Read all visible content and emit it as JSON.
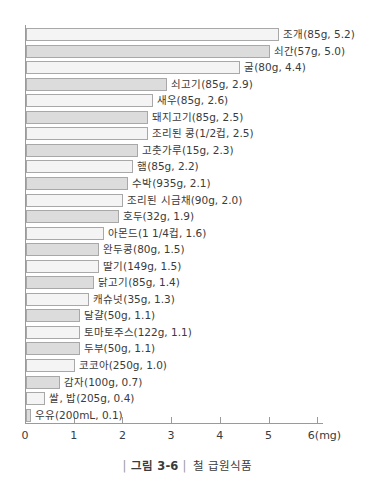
{
  "chart_data": {
    "type": "bar",
    "orientation": "horizontal",
    "title": "철 급원식품",
    "xlabel": "6(mg)",
    "ylabel": "",
    "xlim": [
      0,
      6
    ],
    "xticks": [
      0,
      1,
      2,
      3,
      4,
      5,
      6
    ],
    "xtick_labels": [
      "0",
      "1",
      "2",
      "3",
      "4",
      "5",
      "6(mg)"
    ],
    "grid": false,
    "legend": "none",
    "unit": "mg",
    "categories": [
      "조개",
      "쇠간",
      "굴",
      "쇠고기",
      "새우",
      "돼지고기",
      "조리된 콩",
      "고춧가루",
      "햄",
      "수박",
      "조리된 시금치",
      "호두",
      "아몬드",
      "완두콩",
      "딸기",
      "닭고기",
      "캐슈넛",
      "달걀",
      "토마토주스",
      "두부",
      "코코아",
      "감자",
      "쌀, 밥",
      "우유"
    ],
    "values": [
      5.2,
      5.0,
      4.4,
      2.9,
      2.6,
      2.5,
      2.5,
      2.3,
      2.2,
      2.1,
      2.0,
      1.9,
      1.6,
      1.5,
      1.5,
      1.4,
      1.3,
      1.1,
      1.1,
      1.1,
      1.0,
      0.7,
      0.4,
      0.1
    ],
    "portions": [
      "85g",
      "57g",
      "80g",
      "85g",
      "85g",
      "85g",
      "1/2컵",
      "15g",
      "85g",
      "935g",
      "90g",
      "32g",
      "1 1/4컵",
      "80g",
      "149g",
      "85g",
      "35g",
      "50g",
      "122g",
      "50g",
      "250g",
      "100g",
      "205g",
      "200mL"
    ],
    "bar_labels": [
      "조개(85g, 5.2)",
      "쇠간(57g, 5.0)",
      "굴(80g, 4.4)",
      "쇠고기(85g, 2.9)",
      "새우(85g, 2.6)",
      "돼지고기(85g, 2.5)",
      "조리된 콩(1/2컵, 2.5)",
      "고춧가루(15g, 2.3)",
      "햄(85g, 2.2)",
      "수박(935g, 2.1)",
      "조리된 시금채(90g, 2.0)",
      "호두(32g, 1.9)",
      "아몬드(1 1/4컵, 1.6)",
      "완두콩(80g, 1.5)",
      "딸기(149g, 1.5)",
      "닭고기(85g, 1.4)",
      "캐슈넛(35g, 1.3)",
      "달걀(50g, 1.1)",
      "토마토주스(122g, 1.1)",
      "두부(50g, 1.1)",
      "코코아(250g, 1.0)",
      "감자(100g, 0.7)",
      "쌀, 밥(205g, 0.4)",
      "우유(200mL, 0.1)"
    ],
    "colors": {
      "bar_light": "#f4f4f4",
      "bar_dark": "#dcdcdc",
      "bar_border": "#a8a8a8",
      "axis": "#9a9a9a",
      "text": "#3b3b3b"
    }
  },
  "caption": {
    "prefix_bar": "|",
    "figure_number": "그림 3-6",
    "suffix_bar": "|",
    "title": "철 급원식품"
  }
}
